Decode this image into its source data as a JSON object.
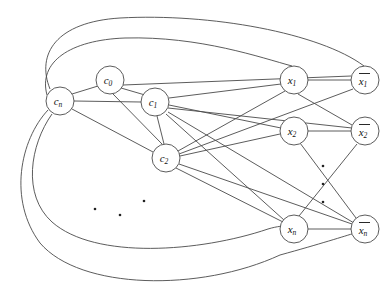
{
  "figure": {
    "background_color": "#ffffff",
    "line_color": "#4a4a4a",
    "label_color": "#111111",
    "width": 392,
    "height": 293
  },
  "nodes": [
    {
      "id": "cn",
      "base": "c",
      "sub": "n",
      "overline": false,
      "cx": 60,
      "cy": 101,
      "r": 14,
      "group": "clause"
    },
    {
      "id": "c0",
      "base": "c",
      "sub": "0",
      "overline": false,
      "cx": 110,
      "cy": 80,
      "r": 14,
      "group": "clause"
    },
    {
      "id": "c1",
      "base": "c",
      "sub": "1",
      "overline": false,
      "cx": 155,
      "cy": 102,
      "r": 14,
      "group": "clause"
    },
    {
      "id": "c2",
      "base": "c",
      "sub": "2",
      "overline": false,
      "cx": 166,
      "cy": 158,
      "r": 14,
      "group": "clause"
    },
    {
      "id": "x1",
      "base": "x",
      "sub": "1",
      "overline": false,
      "cx": 294,
      "cy": 80,
      "r": 14,
      "group": "literal"
    },
    {
      "id": "nx1",
      "base": "x",
      "sub": "1",
      "overline": true,
      "cx": 365,
      "cy": 80,
      "r": 14,
      "group": "literal-negated"
    },
    {
      "id": "x2",
      "base": "x",
      "sub": "2",
      "overline": false,
      "cx": 294,
      "cy": 131,
      "r": 14,
      "group": "literal"
    },
    {
      "id": "nx2",
      "base": "x",
      "sub": "2",
      "overline": true,
      "cx": 365,
      "cy": 131,
      "r": 14,
      "group": "literal-negated"
    },
    {
      "id": "xn",
      "base": "x",
      "sub": "n",
      "overline": false,
      "cx": 294,
      "cy": 229,
      "r": 14,
      "group": "literal"
    },
    {
      "id": "nxn",
      "base": "x",
      "sub": "n",
      "overline": true,
      "cx": 365,
      "cy": 229,
      "r": 14,
      "group": "literal-negated"
    }
  ],
  "straight_edges": [
    {
      "from": "cn",
      "to": "c0"
    },
    {
      "from": "cn",
      "to": "c1"
    },
    {
      "from": "cn",
      "to": "c2"
    },
    {
      "from": "c0",
      "to": "c1"
    },
    {
      "from": "c0",
      "to": "c2"
    },
    {
      "from": "c1",
      "to": "c2"
    },
    {
      "from": "c1",
      "to": "x1"
    },
    {
      "from": "c1",
      "to": "x2"
    },
    {
      "from": "c1",
      "to": "nx2"
    },
    {
      "from": "c1",
      "to": "xn"
    },
    {
      "from": "c1",
      "to": "nxn"
    },
    {
      "from": "c2",
      "to": "x1"
    },
    {
      "from": "c2",
      "to": "x2"
    },
    {
      "from": "c2",
      "to": "nx1"
    },
    {
      "from": "c2",
      "to": "nxn"
    },
    {
      "from": "c2",
      "to": "xn"
    },
    {
      "from": "c0",
      "to": "nx1"
    },
    {
      "from": "x1",
      "to": "nx1"
    },
    {
      "from": "x2",
      "to": "nx2"
    },
    {
      "from": "xn",
      "to": "nxn"
    },
    {
      "from": "x1",
      "to": "nx2"
    },
    {
      "from": "x2",
      "to": "nxn"
    },
    {
      "from": "xn",
      "to": "nx2"
    }
  ],
  "arc_edges": [
    {
      "from": "cn",
      "to": "nx1",
      "side": "top",
      "note": "outer top arc"
    },
    {
      "from": "cn",
      "to": "x1",
      "side": "top",
      "note": "inner top arc"
    },
    {
      "from": "cn",
      "to": "nxn",
      "side": "bottom",
      "note": "outer bottom arc"
    },
    {
      "from": "cn",
      "to": "xn",
      "side": "bottom",
      "note": "inner bottom arc"
    }
  ],
  "ellipses": [
    {
      "name": "clause-ellipsis",
      "orientation": "diagonal",
      "dots": [
        {
          "x": 95,
          "y": 209
        },
        {
          "x": 120,
          "y": 215
        },
        {
          "x": 144,
          "y": 201
        }
      ]
    },
    {
      "name": "literal-ellipsis",
      "orientation": "vertical",
      "dots": [
        {
          "x": 323,
          "y": 166
        },
        {
          "x": 323,
          "y": 184
        },
        {
          "x": 323,
          "y": 202
        }
      ]
    }
  ]
}
